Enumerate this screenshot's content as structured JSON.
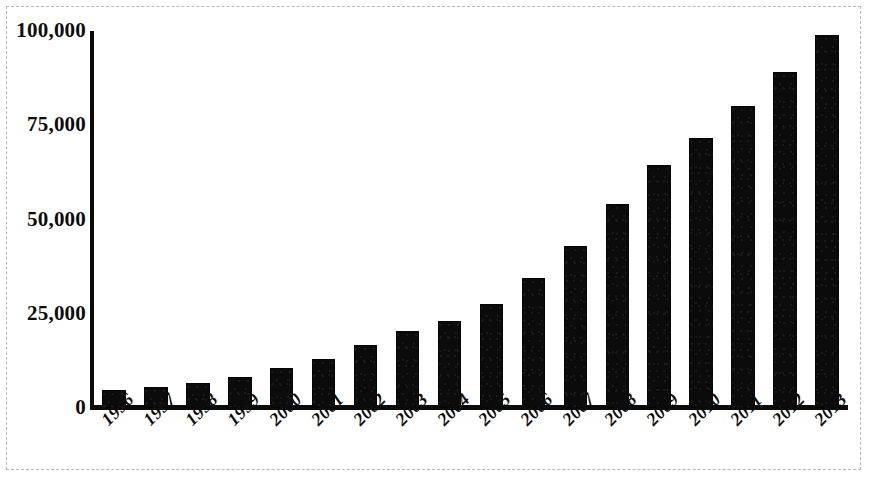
{
  "chart_data": {
    "type": "bar",
    "title": "",
    "xlabel": "",
    "ylabel": "",
    "categories": [
      "1996",
      "1997",
      "1998",
      "1999",
      "2000",
      "2001",
      "2002",
      "2003",
      "2004",
      "2005",
      "2006",
      "2007",
      "2008",
      "2009",
      "2010",
      "2011",
      "2012",
      "2013"
    ],
    "values": [
      4800,
      5600,
      6700,
      8300,
      10500,
      13000,
      16600,
      20500,
      23000,
      27500,
      34500,
      43000,
      54000,
      64500,
      71500,
      80000,
      89000,
      99000
    ],
    "series": [
      {
        "name": "Total",
        "values": [
          4800,
          5600,
          6700,
          8300,
          10500,
          13000,
          16600,
          20500,
          23000,
          27500,
          34500,
          43000,
          54000,
          64500,
          71500,
          80000,
          89000,
          99000
        ]
      }
    ],
    "ylim": [
      0,
      100000
    ],
    "ytick_labels": [
      "0",
      "25,000",
      "50,000",
      "75,000",
      "100,000"
    ],
    "ytick_values": [
      0,
      25000,
      50000,
      75000,
      100000
    ],
    "grid": false,
    "legend": false,
    "legend_position": "none",
    "bar_color": "#0b0b0b",
    "axis_color": "#0a0a0a",
    "background_color": "#ffffff",
    "frame_color": "#b9b9b9"
  }
}
